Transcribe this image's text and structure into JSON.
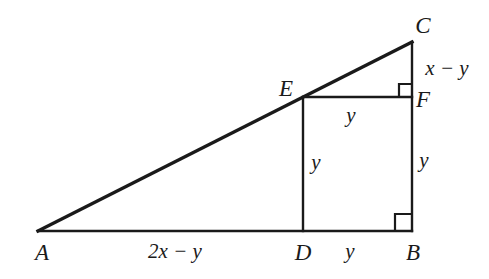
{
  "figure": {
    "type": "geometry-diagram",
    "stroke_color": "#1a1a1a",
    "background_color": "#ffffff",
    "vertices": [
      {
        "id": "A",
        "label": "A",
        "x": 38,
        "y": 231,
        "label_x": 42,
        "label_y": 252
      },
      {
        "id": "B",
        "label": "B",
        "x": 412,
        "y": 231,
        "label_x": 413,
        "label_y": 252
      },
      {
        "id": "C",
        "label": "C",
        "x": 412,
        "y": 42,
        "label_x": 423,
        "label_y": 25
      },
      {
        "id": "D",
        "label": "D",
        "x": 303,
        "y": 231,
        "label_x": 303,
        "label_y": 252
      },
      {
        "id": "E",
        "label": "E",
        "x": 303,
        "y": 97,
        "label_x": 286,
        "label_y": 88
      },
      {
        "id": "F",
        "label": "F",
        "x": 412,
        "y": 97,
        "label_x": 423,
        "label_y": 99
      }
    ],
    "segments": [
      {
        "id": "AB",
        "name": "base",
        "x1": 38,
        "y1": 231,
        "x2": 412,
        "y2": 231,
        "width": 2.4
      },
      {
        "id": "AC",
        "name": "hypotenuse",
        "x1": 38,
        "y1": 231,
        "x2": 412,
        "y2": 42,
        "width": 3.4
      },
      {
        "id": "CB",
        "name": "right-side",
        "x1": 412,
        "y1": 42,
        "x2": 412,
        "y2": 231,
        "width": 2.4
      },
      {
        "id": "ED",
        "name": "inner-vertical",
        "x1": 303,
        "y1": 97,
        "x2": 303,
        "y2": 231,
        "width": 2.4
      },
      {
        "id": "EF",
        "name": "inner-horizontal",
        "x1": 303,
        "y1": 97,
        "x2": 412,
        "y2": 97,
        "width": 2.4
      }
    ],
    "right_angles": [
      {
        "id": "angle-B",
        "at": "B",
        "x": 395,
        "y": 214,
        "size": 17
      },
      {
        "id": "angle-F",
        "at": "F",
        "x": 399,
        "y": 84,
        "size": 13
      }
    ],
    "measures": [
      {
        "id": "AD",
        "text": "2x − y",
        "x": 175,
        "y": 251,
        "for": "segment-AD"
      },
      {
        "id": "DB",
        "text": "y",
        "x": 350,
        "y": 251,
        "for": "segment-DB"
      },
      {
        "id": "CF",
        "text": "x − y",
        "x": 447,
        "y": 68,
        "for": "segment-CF"
      },
      {
        "id": "EF",
        "text": "y",
        "x": 351,
        "y": 115,
        "for": "segment-EF"
      },
      {
        "id": "ED",
        "text": "y",
        "x": 316,
        "y": 162,
        "for": "segment-ED"
      },
      {
        "id": "FB",
        "text": "y",
        "x": 424,
        "y": 160,
        "for": "segment-FB"
      }
    ]
  }
}
